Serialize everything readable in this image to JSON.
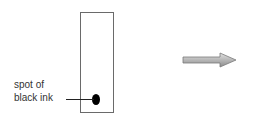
{
  "diagram": {
    "strip": {
      "label": "paper strip"
    },
    "spot": {
      "label_line1": "spot of",
      "label_line2": "black ink",
      "color": "#000000"
    },
    "arrow": {
      "direction": "right",
      "fill_top": "#d8d8d8",
      "fill_bottom": "#8a8a8a"
    }
  }
}
